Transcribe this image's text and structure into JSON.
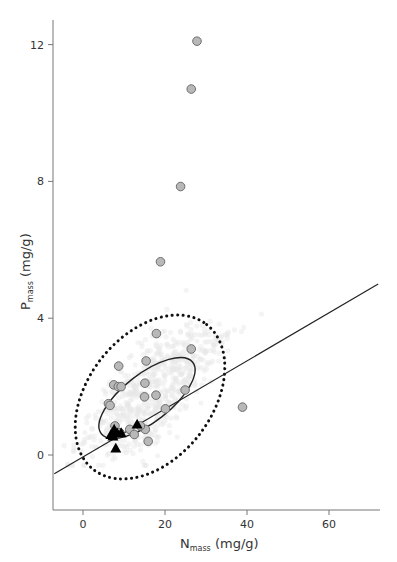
{
  "chart_data": {
    "type": "scatter",
    "title": "",
    "xlabel": "N_mass (mg/g)",
    "ylabel": "P_mass (mg/g)",
    "xlabel_parts": {
      "main": "N",
      "sub": "mass",
      "unit": " (mg/g)"
    },
    "ylabel_parts": {
      "main": "P",
      "sub": "mass",
      "unit": " (mg/g)"
    },
    "xlim": [
      -7,
      72
    ],
    "ylim": [
      -1.6,
      12.4
    ],
    "xticks": [
      0,
      20,
      40,
      60
    ],
    "yticks": [
      0,
      4,
      8,
      12
    ],
    "grid": false,
    "legend": null,
    "colors": {
      "circle_fill": "#b8b8b8",
      "circle_stroke": "#6e6e6e",
      "triangle_fill": "#000000",
      "line": "#222222",
      "background_cloud": "#e6e6e6"
    },
    "series": [
      {
        "name": "circles",
        "marker": "circle",
        "points": [
          [
            27.8,
            12.1
          ],
          [
            26.4,
            10.7
          ],
          [
            23.8,
            7.85
          ],
          [
            18.9,
            5.65
          ],
          [
            17.9,
            3.55
          ],
          [
            26.4,
            3.1
          ],
          [
            15.4,
            2.75
          ],
          [
            8.7,
            2.6
          ],
          [
            7.5,
            2.05
          ],
          [
            8.6,
            2.0
          ],
          [
            9.3,
            2.0
          ],
          [
            6.2,
            1.5
          ],
          [
            6.6,
            1.45
          ],
          [
            15.1,
            2.1
          ],
          [
            17.8,
            1.75
          ],
          [
            15.0,
            1.7
          ],
          [
            24.9,
            1.9
          ],
          [
            20.1,
            1.35
          ],
          [
            38.9,
            1.4
          ],
          [
            15.2,
            0.75
          ],
          [
            14.0,
            0.85
          ],
          [
            7.8,
            0.85
          ],
          [
            11.4,
            0.75
          ],
          [
            12.5,
            0.6
          ],
          [
            15.9,
            0.4
          ],
          [
            9.0,
            0.65
          ]
        ]
      },
      {
        "name": "triangles",
        "marker": "triangle",
        "points": [
          [
            6.8,
            0.6
          ],
          [
            7.6,
            0.75
          ],
          [
            8.3,
            0.65
          ],
          [
            9.3,
            0.65
          ],
          [
            7.3,
            0.55
          ],
          [
            13.2,
            0.9
          ],
          [
            8.0,
            0.2
          ]
        ]
      }
    ],
    "regression_line": {
      "x": [
        -7,
        72
      ],
      "y": [
        -0.55,
        5.0
      ]
    },
    "ellipses": [
      {
        "name": "inner",
        "style": "solid",
        "center": [
          15.5,
          1.65
        ],
        "rx_deg": 33,
        "note": "tilted ellipse around core points"
      },
      {
        "name": "outer",
        "style": "dotted",
        "center": [
          16.0,
          1.45
        ],
        "note": "95% ellipse"
      }
    ]
  }
}
